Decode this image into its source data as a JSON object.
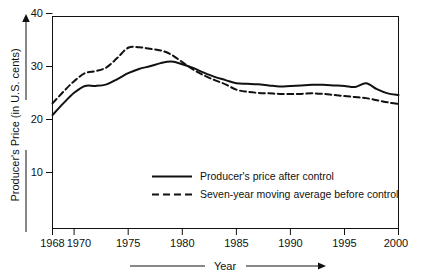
{
  "chart_data": {
    "type": "line",
    "title": "",
    "xlabel": "Year",
    "ylabel": "Producer's Price (in U.S. cents)",
    "xlim": [
      1968,
      2000
    ],
    "ylim": [
      0,
      40
    ],
    "grid": false,
    "legend_position": "center",
    "xticks": [
      1968,
      1970,
      1975,
      1980,
      1985,
      1990,
      1995,
      2000
    ],
    "xtick_labels": [
      "1968",
      "1970",
      "1975",
      "1980",
      "1985",
      "1990",
      "1995",
      "2000"
    ],
    "yticks": [
      10,
      20,
      30,
      40
    ],
    "ytick_labels": [
      "10",
      "20",
      "30",
      "40"
    ],
    "x": [
      1968,
      1969,
      1970,
      1971,
      1972,
      1973,
      1974,
      1975,
      1976,
      1977,
      1978,
      1979,
      1980,
      1981,
      1982,
      1983,
      1984,
      1985,
      1986,
      1987,
      1988,
      1989,
      1990,
      1991,
      1992,
      1993,
      1994,
      1995,
      1996,
      1997,
      1998,
      1999,
      2000
    ],
    "series": [
      {
        "name": "Producer's price after control",
        "style": "solid",
        "color": "#111111",
        "values": [
          21.4,
          23.6,
          25.6,
          26.9,
          26.9,
          27.2,
          28.2,
          29.3,
          30.1,
          30.6,
          31.2,
          31.5,
          31.0,
          30.3,
          29.4,
          28.6,
          28.0,
          27.4,
          27.3,
          27.2,
          27.0,
          26.8,
          26.9,
          27.0,
          27.1,
          27.1,
          27.0,
          26.9,
          26.7,
          27.4,
          26.3,
          25.5,
          25.2
        ]
      },
      {
        "name": "Seven-year moving average before control",
        "style": "dashed",
        "color": "#111111",
        "values": [
          23.6,
          25.8,
          27.8,
          29.3,
          29.7,
          30.4,
          32.2,
          34.1,
          34.2,
          33.9,
          33.6,
          32.8,
          31.4,
          30.0,
          28.9,
          28.0,
          27.2,
          26.2,
          25.8,
          25.6,
          25.5,
          25.4,
          25.4,
          25.4,
          25.5,
          25.4,
          25.2,
          25.0,
          24.8,
          24.6,
          24.2,
          23.8,
          23.5
        ]
      }
    ]
  },
  "legend": {
    "entries": [
      {
        "label": "Producer's price after control",
        "style": "solid"
      },
      {
        "label": "Seven-year moving average before control",
        "style": "dashed"
      }
    ]
  },
  "axes": {
    "y_axis_title": "Producer's Price (in U.S. cents)",
    "x_axis_title": "Year"
  }
}
